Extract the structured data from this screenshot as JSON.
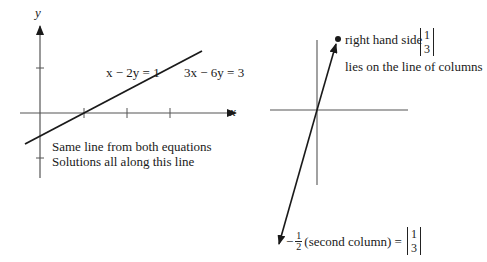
{
  "left_panel": {
    "axis_labels": {
      "x": "x",
      "y": "y"
    },
    "equation_1": "x − 2y = 1",
    "equation_2": "3x − 6y = 3",
    "note_1": "Same line from both equations",
    "note_2": "Solutions all along this line"
  },
  "right_panel": {
    "rhs_label": "right hand side",
    "rhs_vector": [
      "1",
      "3"
    ],
    "rhs_note": "lies on the line of columns",
    "bottom_prefix": "−",
    "bottom_fraction": {
      "num": "1",
      "den": "2"
    },
    "bottom_text": "(second column) =",
    "bottom_vector": [
      "1",
      "3"
    ]
  },
  "colors": {
    "ink": "#1a1a1a",
    "axis": "#555555"
  }
}
